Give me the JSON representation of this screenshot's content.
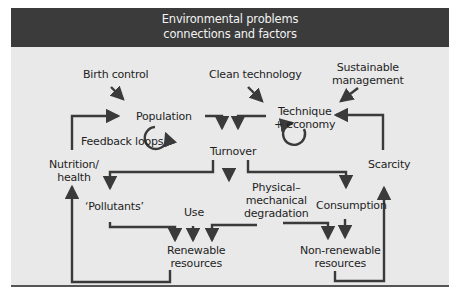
{
  "title": {
    "line1": "Environmental problems",
    "line2": "connections and factors"
  },
  "nodes": {
    "birth_control": "Birth control",
    "clean_technology": "Clean technology",
    "sustainable_management_1": "Sustainable",
    "sustainable_management_2": "management",
    "population": "Population",
    "technique_1": "Technique",
    "technique_2": "+ economy",
    "feedback_loops": "Feedback loops",
    "turnover": "Turnover",
    "nutrition_1": "Nutrition/",
    "nutrition_2": "health",
    "scarcity": "Scarcity",
    "pollutants": "‘Pollutants’",
    "physical_1": "Physical–",
    "physical_2": "mechanical",
    "physical_3": "degradation",
    "consumption": "Consumption",
    "use": "Use",
    "renewable_1": "Renewable",
    "renewable_2": "resources",
    "nonrenewable_1": "Non-renewable",
    "nonrenewable_2": "resources"
  },
  "colors": {
    "header_bg": "#3b3b3b",
    "panel_bg": "#e9e9e9",
    "arrow": "#3a3a3a"
  }
}
